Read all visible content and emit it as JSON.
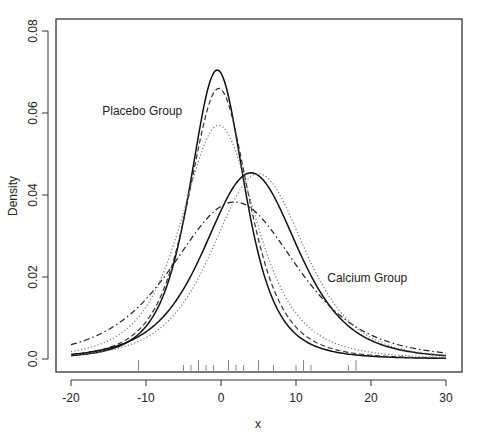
{
  "chart_data": {
    "type": "line",
    "title": "",
    "xlabel": "x",
    "ylabel": "Density",
    "xlim": [
      -20,
      30
    ],
    "ylim": [
      0,
      0.08
    ],
    "x_ticks": [
      -20,
      -10,
      0,
      10,
      20,
      30
    ],
    "x_tick_labels": [
      "-20",
      "-10",
      "0",
      "10",
      "20",
      "30"
    ],
    "y_ticks": [
      0,
      0.02,
      0.04,
      0.06,
      0.08
    ],
    "y_tick_labels": [
      "0.0",
      "0.02",
      "0.04",
      "0.06",
      "0.08"
    ],
    "grid": false,
    "legend": "none",
    "annotations": [
      {
        "text": "Placebo Group",
        "x": -10.5,
        "y": 0.0595
      },
      {
        "text": "Calcium Group",
        "x": 19.5,
        "y": 0.0189
      }
    ],
    "series": [
      {
        "name": "Placebo solid",
        "group": "Placebo",
        "style": "solid",
        "peak_x": -0.5,
        "peak_y": 0.0705,
        "scale": 3.9,
        "df": 3
      },
      {
        "name": "Placebo dashed",
        "group": "Placebo",
        "style": "dashed",
        "peak_x": -0.3,
        "peak_y": 0.066,
        "scale": 4.3,
        "df": 3
      },
      {
        "name": "Placebo dotted",
        "group": "Placebo",
        "style": "dotted",
        "peak_x": -0.3,
        "peak_y": 0.057,
        "scale": 5.3,
        "df": 3
      },
      {
        "name": "Calcium solid",
        "group": "Calcium",
        "style": "solid",
        "peak_x": 4.0,
        "peak_y": 0.0454,
        "scale": 6.5,
        "df": 4
      },
      {
        "name": "Calcium dashdot",
        "group": "Calcium",
        "style": "dashdot",
        "peak_x": 1.8,
        "peak_y": 0.0383,
        "scale": 8.6,
        "df": 4
      },
      {
        "name": "Calcium dotted",
        "group": "Calcium",
        "style": "dotted",
        "peak_x": 5.0,
        "peak_y": 0.0452,
        "scale": 6.4,
        "df": 4
      }
    ],
    "rug": [
      -11,
      -5,
      -4,
      -3,
      -2,
      -1,
      1,
      2,
      3,
      5,
      7,
      10,
      11,
      12,
      17,
      18
    ]
  }
}
